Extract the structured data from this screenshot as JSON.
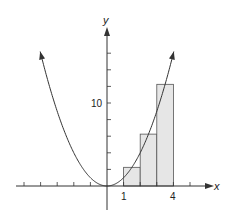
{
  "chart_data": {
    "type": "line",
    "title": "",
    "xlabel": "x",
    "ylabel": "y",
    "function": "y = x^2",
    "xlim": [
      -5.8,
      6.0
    ],
    "ylim": [
      -1.5,
      16
    ],
    "x_ticks": [
      -5,
      -4,
      -3,
      -2,
      -1,
      1,
      2,
      3,
      4,
      5
    ],
    "x_tick_labels": [
      {
        "value": 1,
        "label": "1"
      },
      {
        "value": 4,
        "label": "4"
      }
    ],
    "y_ticks": [
      2,
      4,
      6,
      8,
      10,
      12,
      14,
      16
    ],
    "y_tick_labels": [
      {
        "value": 10,
        "label": "10"
      }
    ],
    "rectangles": [
      {
        "x0": 1,
        "x1": 2,
        "height": 2.25
      },
      {
        "x0": 2,
        "x1": 3,
        "height": 6.25
      },
      {
        "x0": 3,
        "x1": 4,
        "height": 12.25
      }
    ],
    "rectangle_fill": "#e6e6e6",
    "curve_color": "#333333",
    "grid": false,
    "legend": null
  },
  "labels": {
    "x_axis": "x",
    "y_axis": "y",
    "tick_1": "1",
    "tick_4": "4",
    "tick_10": "10"
  }
}
